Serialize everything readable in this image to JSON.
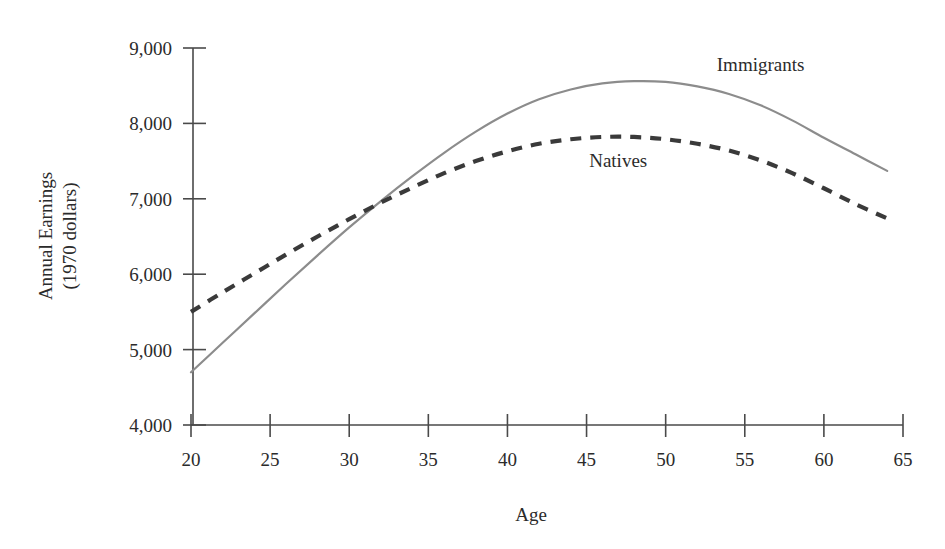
{
  "chart_data": {
    "type": "line",
    "title": "",
    "xlabel": "Age",
    "ylabel": "Annual Earnings\n(1970 dollars)",
    "ylabel_line1": "Annual Earnings",
    "ylabel_line2": "(1970 dollars)",
    "xlim": [
      20,
      65
    ],
    "ylim": [
      4000,
      9000
    ],
    "xticks": [
      20,
      25,
      30,
      35,
      40,
      45,
      50,
      55,
      60,
      65
    ],
    "xticklabels": [
      "20",
      "25",
      "30",
      "35",
      "40",
      "45",
      "50",
      "55",
      "60",
      "65"
    ],
    "yticks": [
      4000,
      5000,
      6000,
      7000,
      8000,
      9000
    ],
    "yticklabels": [
      "4,000",
      "5,000",
      "6,000",
      "7,000",
      "8,000",
      "9,000"
    ],
    "grid": false,
    "legend": "inline-annotations",
    "series": [
      {
        "name": "Immigrants",
        "style": "solid",
        "color": "#8c8c8c",
        "label_x": 56,
        "label_y": 8700,
        "x": [
          20,
          22,
          24,
          26,
          28,
          30,
          32,
          34,
          36,
          38,
          40,
          42,
          44,
          46,
          48,
          50,
          52,
          54,
          56,
          58,
          60,
          62,
          64
        ],
        "values": [
          4700,
          5090,
          5480,
          5870,
          6250,
          6620,
          6970,
          7300,
          7610,
          7890,
          8130,
          8320,
          8450,
          8530,
          8560,
          8550,
          8490,
          8390,
          8240,
          8040,
          7810,
          7590,
          7370
        ]
      },
      {
        "name": "Natives",
        "style": "dashed",
        "color": "#3a3a3a",
        "label_x": 47,
        "label_y": 7420,
        "x": [
          20,
          22,
          24,
          26,
          28,
          30,
          32,
          34,
          36,
          38,
          40,
          42,
          44,
          46,
          48,
          50,
          52,
          54,
          56,
          58,
          60,
          62,
          64
        ],
        "values": [
          5500,
          5760,
          6010,
          6260,
          6500,
          6730,
          6950,
          7150,
          7340,
          7500,
          7630,
          7730,
          7790,
          7820,
          7820,
          7790,
          7730,
          7640,
          7510,
          7340,
          7140,
          6930,
          6740
        ]
      }
    ],
    "annotations": [
      {
        "text": "Immigrants",
        "x": 56,
        "y": 8700
      },
      {
        "text": "Natives",
        "x": 47,
        "y": 7420
      }
    ]
  },
  "axes": {
    "x_title": "Age",
    "y_title_line1": "Annual Earnings",
    "y_title_line2": "(1970 dollars)"
  }
}
